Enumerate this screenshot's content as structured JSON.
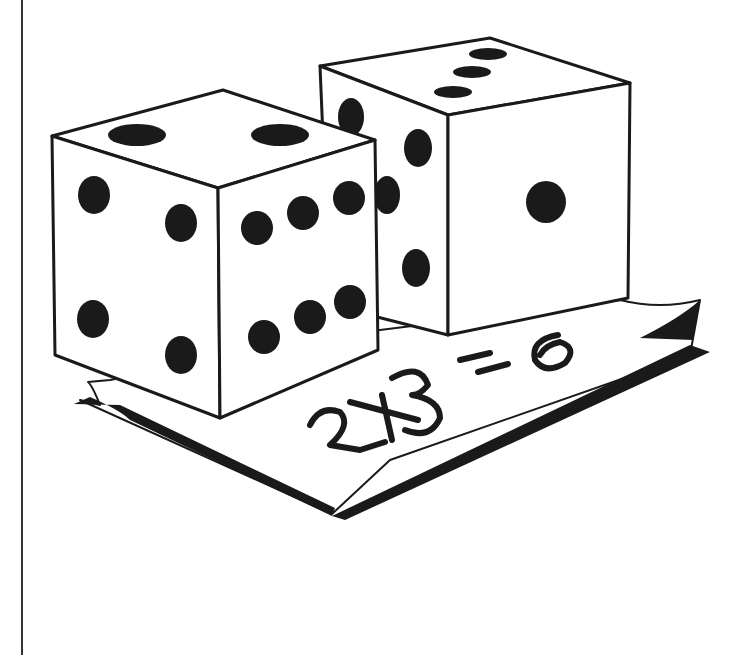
{
  "illustration": {
    "subject": "Two dice on a sheet of paper",
    "equation_text": "2X3=6",
    "colors": {
      "ink": "#1a1a1a",
      "paper": "#ffffff",
      "rule": "#333333"
    },
    "front_die": {
      "top_face": 2,
      "left_face": 4,
      "right_face": 6
    },
    "back_die": {
      "top_face": 3,
      "left_face": 4,
      "right_face": 1
    }
  }
}
